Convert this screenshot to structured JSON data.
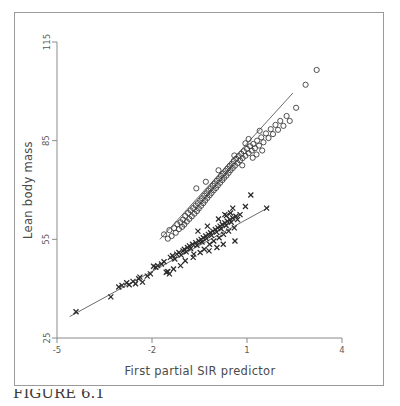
{
  "figure": {
    "caption": "FIGURE 6.1",
    "frame_color": "#9a9a9a",
    "background": "#ffffff"
  },
  "chart_data": {
    "type": "scatter",
    "title": "",
    "xlabel": "First partial SIR predictor",
    "ylabel": "Lean body mass",
    "xlim": [
      -5,
      4
    ],
    "ylim": [
      25,
      115
    ],
    "xticks": [
      -5,
      -2,
      1,
      4
    ],
    "yticks": [
      25,
      55,
      85,
      115
    ],
    "xtick_labels": [
      "-5",
      "-2",
      "1",
      "4"
    ],
    "ytick_labels": [
      "25",
      "55",
      "85",
      "115"
    ],
    "grid": false,
    "legend_position": "none",
    "axis_color": "#8a8a8a",
    "series": [
      {
        "name": "circles",
        "marker": "open-circle",
        "color": "#3c3c3c",
        "points": [
          [
            -1.62,
            56.5
          ],
          [
            -1.5,
            55.2
          ],
          [
            -1.45,
            57.8
          ],
          [
            -1.38,
            56.0
          ],
          [
            -1.3,
            58.4
          ],
          [
            -1.25,
            57.0
          ],
          [
            -1.2,
            59.6
          ],
          [
            -1.15,
            58.1
          ],
          [
            -1.1,
            60.2
          ],
          [
            -1.05,
            58.8
          ],
          [
            -1.02,
            61.0
          ],
          [
            -0.98,
            59.5
          ],
          [
            -0.95,
            62.1
          ],
          [
            -0.9,
            60.4
          ],
          [
            -0.86,
            63.0
          ],
          [
            -0.82,
            61.2
          ],
          [
            -0.78,
            63.8
          ],
          [
            -0.74,
            62.0
          ],
          [
            -0.7,
            64.5
          ],
          [
            -0.66,
            62.8
          ],
          [
            -0.62,
            65.3
          ],
          [
            -0.58,
            63.6
          ],
          [
            -0.55,
            66.0
          ],
          [
            -0.52,
            64.4
          ],
          [
            -0.48,
            66.8
          ],
          [
            -0.45,
            65.2
          ],
          [
            -0.42,
            67.5
          ],
          [
            -0.38,
            66.0
          ],
          [
            -0.35,
            68.3
          ],
          [
            -0.32,
            66.8
          ],
          [
            -0.28,
            69.0
          ],
          [
            -0.25,
            67.6
          ],
          [
            -0.22,
            69.8
          ],
          [
            -0.18,
            68.4
          ],
          [
            -0.15,
            70.5
          ],
          [
            -0.12,
            69.1
          ],
          [
            -0.08,
            71.3
          ],
          [
            -0.05,
            69.9
          ],
          [
            -0.02,
            72.0
          ],
          [
            0.02,
            70.6
          ],
          [
            0.05,
            72.8
          ],
          [
            0.08,
            71.4
          ],
          [
            0.12,
            73.5
          ],
          [
            0.15,
            72.2
          ],
          [
            0.18,
            74.3
          ],
          [
            0.22,
            73.0
          ],
          [
            0.25,
            75.0
          ],
          [
            0.28,
            73.7
          ],
          [
            0.32,
            75.8
          ],
          [
            0.35,
            74.4
          ],
          [
            0.38,
            76.5
          ],
          [
            0.42,
            75.2
          ],
          [
            0.45,
            77.3
          ],
          [
            0.48,
            76.0
          ],
          [
            0.52,
            78.0
          ],
          [
            0.55,
            76.7
          ],
          [
            0.58,
            78.8
          ],
          [
            0.62,
            77.4
          ],
          [
            0.66,
            79.5
          ],
          [
            0.7,
            78.2
          ],
          [
            0.74,
            80.3
          ],
          [
            0.78,
            79.0
          ],
          [
            0.82,
            81.0
          ],
          [
            0.86,
            79.7
          ],
          [
            0.9,
            81.8
          ],
          [
            0.95,
            80.4
          ],
          [
            1.0,
            82.5
          ],
          [
            1.05,
            81.2
          ],
          [
            1.1,
            83.3
          ],
          [
            1.15,
            82.0
          ],
          [
            1.2,
            84.0
          ],
          [
            1.25,
            82.7
          ],
          [
            1.32,
            85.0
          ],
          [
            1.38,
            83.5
          ],
          [
            1.45,
            86.0
          ],
          [
            1.52,
            84.5
          ],
          [
            1.6,
            87.2
          ],
          [
            1.68,
            85.8
          ],
          [
            1.75,
            88.5
          ],
          [
            1.82,
            87.0
          ],
          [
            1.9,
            89.8
          ],
          [
            1.98,
            88.3
          ],
          [
            2.05,
            91.0
          ],
          [
            2.15,
            89.5
          ],
          [
            2.25,
            92.5
          ],
          [
            2.35,
            91.0
          ],
          [
            2.55,
            95.0
          ],
          [
            2.85,
            102.0
          ],
          [
            3.2,
            106.5
          ],
          [
            -0.6,
            70.5
          ],
          [
            -0.3,
            72.5
          ],
          [
            0.1,
            76.0
          ],
          [
            0.6,
            80.5
          ],
          [
            1.05,
            85.5
          ],
          [
            1.4,
            88.0
          ],
          [
            0.85,
            77.5
          ],
          [
            1.18,
            79.8
          ],
          [
            1.3,
            80.8
          ],
          [
            0.95,
            84.2
          ],
          [
            1.48,
            82.0
          ]
        ]
      },
      {
        "name": "crosses",
        "marker": "x",
        "color": "#2a2a2a",
        "points": [
          [
            -4.4,
            33.0
          ],
          [
            -3.3,
            37.5
          ],
          [
            -3.05,
            40.5
          ],
          [
            -2.95,
            41.0
          ],
          [
            -2.8,
            41.8
          ],
          [
            -2.72,
            41.2
          ],
          [
            -2.6,
            42.2
          ],
          [
            -2.42,
            43.0
          ],
          [
            -2.38,
            43.5
          ],
          [
            -2.3,
            42.0
          ],
          [
            -2.05,
            44.5
          ],
          [
            -1.95,
            46.8
          ],
          [
            -1.88,
            46.5
          ],
          [
            -1.82,
            47.0
          ],
          [
            -1.7,
            47.5
          ],
          [
            -1.62,
            48.2
          ],
          [
            -1.55,
            45.0
          ],
          [
            -1.5,
            45.2
          ],
          [
            -1.42,
            49.5
          ],
          [
            -1.35,
            50.0
          ],
          [
            -1.28,
            49.0
          ],
          [
            -1.22,
            50.5
          ],
          [
            -1.15,
            51.0
          ],
          [
            -1.08,
            50.2
          ],
          [
            -1.02,
            51.5
          ],
          [
            -0.98,
            52.0
          ],
          [
            -0.92,
            51.2
          ],
          [
            -0.88,
            52.5
          ],
          [
            -0.82,
            53.0
          ],
          [
            -0.78,
            52.2
          ],
          [
            -0.72,
            53.5
          ],
          [
            -0.68,
            50.5
          ],
          [
            -0.62,
            54.0
          ],
          [
            -0.58,
            53.2
          ],
          [
            -0.52,
            54.5
          ],
          [
            -0.48,
            51.0
          ],
          [
            -0.45,
            55.0
          ],
          [
            -0.42,
            54.2
          ],
          [
            -0.38,
            55.5
          ],
          [
            -0.35,
            52.0
          ],
          [
            -0.3,
            56.0
          ],
          [
            -0.28,
            55.2
          ],
          [
            -0.22,
            56.5
          ],
          [
            -0.18,
            53.5
          ],
          [
            -0.15,
            57.0
          ],
          [
            -0.12,
            56.2
          ],
          [
            -0.08,
            57.5
          ],
          [
            -0.05,
            54.5
          ],
          [
            0.0,
            58.0
          ],
          [
            0.04,
            57.2
          ],
          [
            0.08,
            58.5
          ],
          [
            0.12,
            55.5
          ],
          [
            0.15,
            59.0
          ],
          [
            0.18,
            58.2
          ],
          [
            0.22,
            59.5
          ],
          [
            0.26,
            56.5
          ],
          [
            0.3,
            60.0
          ],
          [
            0.34,
            59.2
          ],
          [
            0.38,
            60.5
          ],
          [
            0.42,
            57.5
          ],
          [
            0.46,
            61.0
          ],
          [
            0.5,
            60.2
          ],
          [
            0.55,
            61.5
          ],
          [
            0.6,
            58.5
          ],
          [
            0.65,
            62.0
          ],
          [
            0.7,
            61.0
          ],
          [
            0.3,
            62.5
          ],
          [
            0.48,
            63.0
          ],
          [
            0.55,
            64.5
          ],
          [
            0.62,
            54.5
          ],
          [
            0.78,
            62.5
          ],
          [
            0.95,
            65.0
          ],
          [
            1.12,
            68.5
          ],
          [
            1.62,
            64.5
          ],
          [
            -1.45,
            44.5
          ],
          [
            -0.95,
            48.5
          ],
          [
            -0.7,
            49.5
          ],
          [
            -0.2,
            51.5
          ],
          [
            0.05,
            52.5
          ],
          [
            0.25,
            53.5
          ],
          [
            -0.55,
            57.5
          ],
          [
            -0.25,
            59.0
          ],
          [
            0.1,
            61.2
          ],
          [
            0.35,
            62.2
          ],
          [
            -1.1,
            47.0
          ],
          [
            -2.15,
            43.8
          ],
          [
            -2.52,
            41.5
          ],
          [
            -1.32,
            46.0
          ]
        ]
      }
    ],
    "fit_lines": [
      {
        "name": "circles-fit",
        "x0": -1.75,
        "y0": 55.0,
        "x1": 2.45,
        "y1": 99.5,
        "color": "#5a5a5a"
      },
      {
        "name": "crosses-fit",
        "x0": -4.6,
        "y0": 31.5,
        "x1": 1.7,
        "y1": 64.8,
        "color": "#5a5a5a"
      }
    ]
  }
}
